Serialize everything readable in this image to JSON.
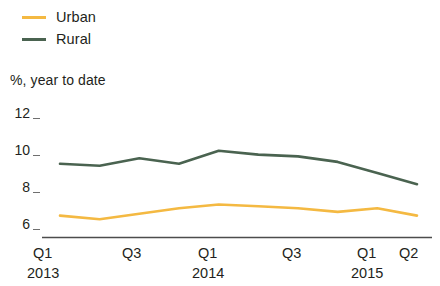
{
  "legend": {
    "items": [
      {
        "label": "Urban",
        "color": "#f4b942"
      },
      {
        "label": "Rural",
        "color": "#4a6350"
      }
    ]
  },
  "axis_caption": "%, year to date",
  "y_axis": {
    "ticks": [
      "12",
      "10",
      "8",
      "6"
    ]
  },
  "x_axis": {
    "quarter_labels": [
      "Q1",
      "Q3",
      "Q1",
      "Q3",
      "Q1",
      "Q2"
    ],
    "year_labels": [
      "2013",
      "2014",
      "2015"
    ]
  },
  "chart_data": {
    "type": "line",
    "title": "",
    "subtitle": "",
    "xlabel": "",
    "ylabel": "%, year to date",
    "ylim": [
      5.2,
      12.6
    ],
    "yticks": [
      6,
      8,
      10,
      12
    ],
    "grid": false,
    "legend_position": "top-left",
    "x": [
      "Q1 2013",
      "Q2 2013",
      "Q3 2013",
      "Q4 2013",
      "Q1 2014",
      "Q2 2014",
      "Q3 2014",
      "Q4 2014",
      "Q1 2015",
      "Q2 2015"
    ],
    "xtick_labels": [
      "Q1",
      "",
      "Q3",
      "",
      "Q1",
      "",
      "Q3",
      "",
      "Q1",
      "Q2"
    ],
    "xtick_years": [
      "2013",
      "",
      "",
      "",
      "2014",
      "",
      "",
      "",
      "2015",
      ""
    ],
    "series": [
      {
        "name": "Urban",
        "color": "#f4b942",
        "values": [
          6.4,
          6.2,
          6.5,
          6.8,
          7.0,
          6.9,
          6.8,
          6.6,
          6.8,
          6.4
        ]
      },
      {
        "name": "Rural",
        "color": "#4a6350",
        "values": [
          9.2,
          9.1,
          9.5,
          9.2,
          9.9,
          9.7,
          9.6,
          9.3,
          8.7,
          8.1
        ]
      }
    ]
  }
}
